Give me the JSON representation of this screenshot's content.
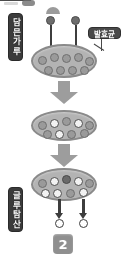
{
  "figure": {
    "step_number": "2",
    "colors": {
      "cell_fill": "#b3b3b3",
      "cell_border": "#8a8a8a",
      "granule_gray": "#9a9a9a",
      "granule_white": "#f2f2f2",
      "bacteria_dark": "#6d6d6d",
      "label_dark": "#3b3b3b",
      "label_mid": "#4a4a4a",
      "block_arrow": "#9d9d9d",
      "badge": "#8f8f8f",
      "background": "#ffffff"
    }
  },
  "labels": {
    "powder": "담믄가루",
    "microbe": "발효균",
    "glutamic_acid": "글루탐산"
  },
  "stages": [
    {
      "name": "stage-1-inoculation",
      "external_bacteria": 2,
      "granules": [
        {
          "type": "gray",
          "x": 5,
          "y": 10
        },
        {
          "type": "gray",
          "x": 17,
          "y": 7
        },
        {
          "type": "gray",
          "x": 29,
          "y": 8
        },
        {
          "type": "gray",
          "x": 41,
          "y": 7
        },
        {
          "type": "gray",
          "x": 52,
          "y": 11
        },
        {
          "type": "gray",
          "x": 11,
          "y": 20
        },
        {
          "type": "gray",
          "x": 23,
          "y": 20
        },
        {
          "type": "gray",
          "x": 35,
          "y": 20
        },
        {
          "type": "gray",
          "x": 47,
          "y": 20
        }
      ]
    },
    {
      "name": "stage-2-fermentation",
      "external_bacteria": 0,
      "granules": [
        {
          "type": "gray",
          "x": 5,
          "y": 9
        },
        {
          "type": "white",
          "x": 17,
          "y": 7
        },
        {
          "type": "gray",
          "x": 29,
          "y": 5
        },
        {
          "type": "white",
          "x": 41,
          "y": 7
        },
        {
          "type": "gray",
          "x": 52,
          "y": 9
        },
        {
          "type": "gray",
          "x": 10,
          "y": 18
        },
        {
          "type": "white",
          "x": 22,
          "y": 18
        },
        {
          "type": "gray",
          "x": 34,
          "y": 18
        },
        {
          "type": "gray",
          "x": 47,
          "y": 17
        }
      ]
    },
    {
      "name": "stage-3-product-release",
      "external_bacteria": 0,
      "granules": [
        {
          "type": "gray",
          "x": 5,
          "y": 9
        },
        {
          "type": "white",
          "x": 17,
          "y": 7
        },
        {
          "type": "dark",
          "x": 29,
          "y": 5
        },
        {
          "type": "white",
          "x": 41,
          "y": 7
        },
        {
          "type": "gray",
          "x": 52,
          "y": 9
        },
        {
          "type": "white",
          "x": 8,
          "y": 19
        },
        {
          "type": "white",
          "x": 20,
          "y": 19
        },
        {
          "type": "gray",
          "x": 33,
          "y": 19
        },
        {
          "type": "white",
          "x": 46,
          "y": 18
        }
      ],
      "products_released": 2
    }
  ],
  "flow_arrows": [
    {
      "name": "flow-arrow-1",
      "direction": "down"
    },
    {
      "name": "flow-arrow-2",
      "direction": "down"
    }
  ]
}
